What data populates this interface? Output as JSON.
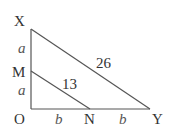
{
  "diagram": {
    "points": {
      "X": "X",
      "M": "M",
      "O": "O",
      "N": "N",
      "Y": "Y"
    },
    "segment_labels": {
      "XM": "a",
      "MO": "a",
      "ON": "b",
      "NY": "b",
      "XY": "26",
      "MN": "13"
    },
    "line_color": "#555555"
  }
}
